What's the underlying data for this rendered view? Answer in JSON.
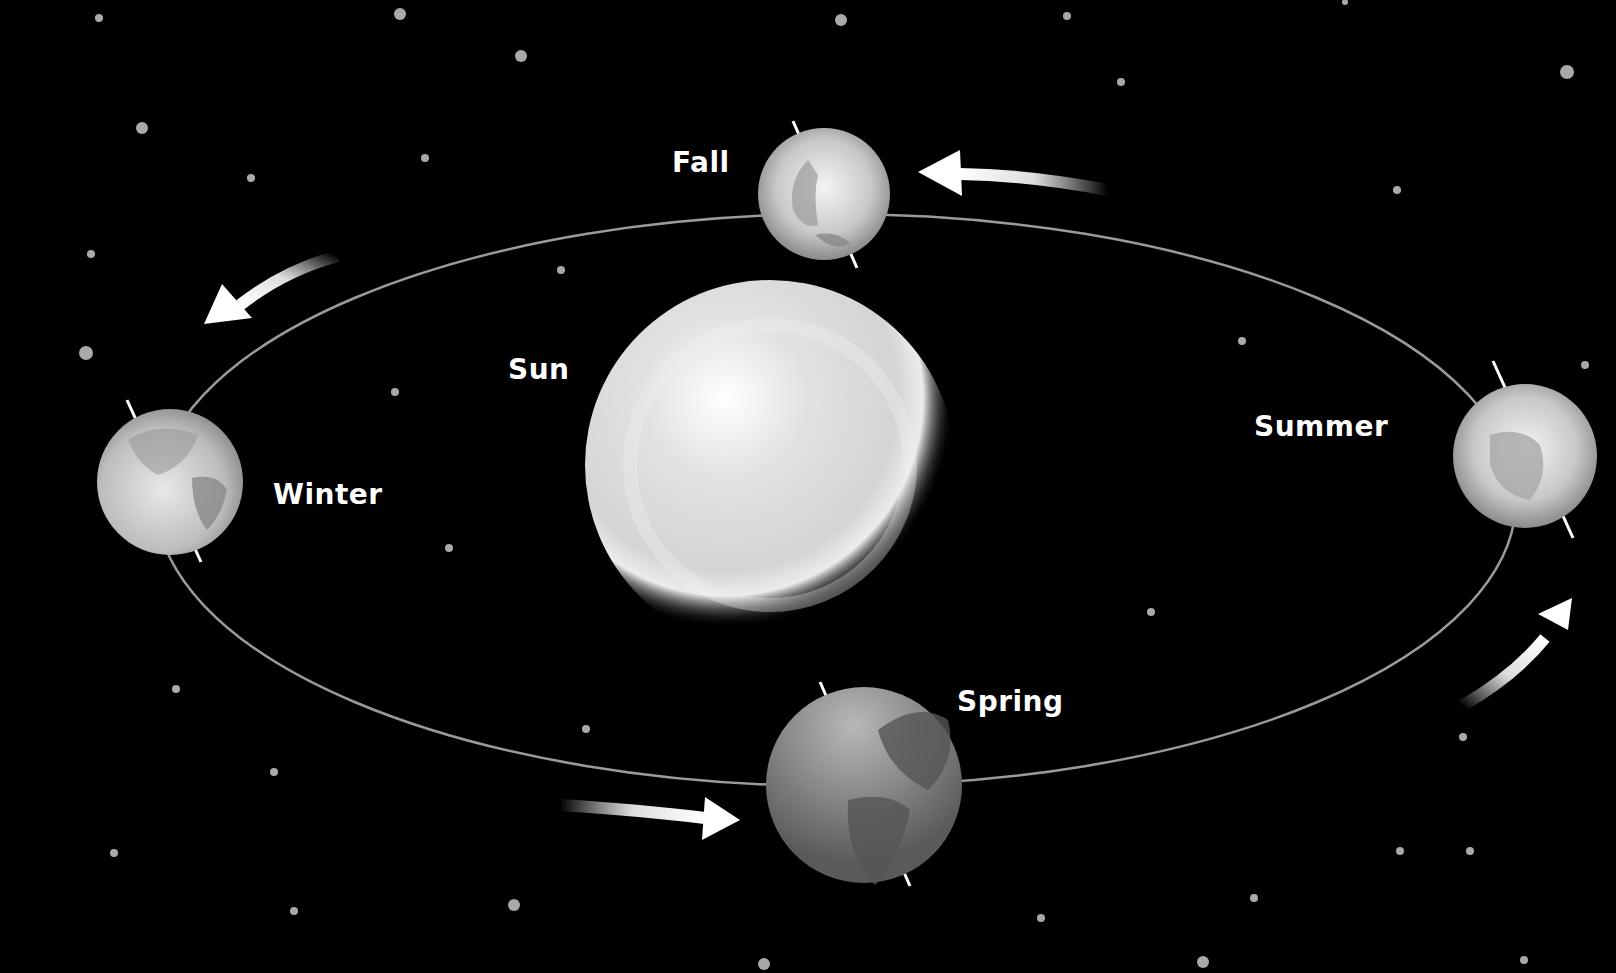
{
  "diagram": {
    "title": "",
    "background_color": "#000000",
    "center": {
      "name": "Sun",
      "label": "Sun"
    },
    "orbit": {
      "cx": 836,
      "cy": 500,
      "rx": 680,
      "ry": 286,
      "stroke": "#9a9a9a"
    },
    "seasons": [
      {
        "id": "fall",
        "label": "Fall"
      },
      {
        "id": "winter",
        "label": "Winter"
      },
      {
        "id": "summer",
        "label": "Summer"
      },
      {
        "id": "spring",
        "label": "Spring"
      }
    ],
    "arrows": [
      {
        "id": "arrow-top",
        "direction": "left"
      },
      {
        "id": "arrow-left",
        "direction": "down-left"
      },
      {
        "id": "arrow-bottom",
        "direction": "right"
      },
      {
        "id": "arrow-right",
        "direction": "up-right"
      }
    ]
  }
}
